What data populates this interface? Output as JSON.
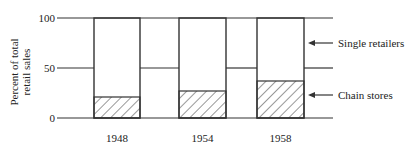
{
  "chart_data": {
    "type": "bar",
    "stacked": true,
    "title": "",
    "xlabel": "",
    "ylabel": "Percent of total retail sales",
    "ylim": [
      0,
      100
    ],
    "yticks": [
      0,
      50,
      100
    ],
    "categories": [
      "1948",
      "1954",
      "1958"
    ],
    "series": [
      {
        "name": "Chain stores",
        "pattern": "hatched",
        "values": [
          21,
          27,
          37
        ]
      },
      {
        "name": "Single retailers",
        "pattern": "blank",
        "values": [
          79,
          73,
          63
        ]
      }
    ],
    "annotations": [
      {
        "text": "Single retailers",
        "arrow": "left"
      },
      {
        "text": "Chain stores",
        "arrow": "left"
      }
    ],
    "grid": false
  },
  "labels": {
    "ylabel_line1": "Percent of total",
    "ylabel_line2": "retail sales",
    "tick_0": "0",
    "tick_50": "50",
    "tick_100": "100",
    "cat_0": "1948",
    "cat_1": "1954",
    "cat_2": "1958",
    "legend_single": "Single retailers",
    "legend_chain": "Chain stores"
  }
}
